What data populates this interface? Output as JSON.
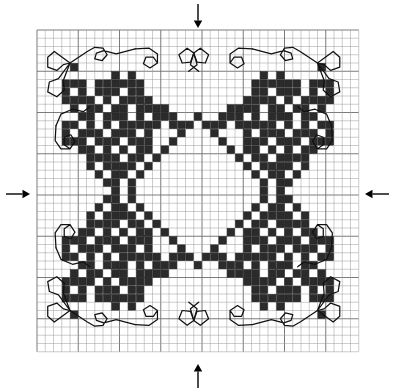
{
  "document": {
    "type": "cross-stitch-pattern-chart",
    "title": "Cross Stitch Pattern Chart",
    "description": "Symmetrical needlework chart with four corner floral motifs, a central open diamond, and backstitch scroll borders"
  },
  "colors": {
    "background": "#ffffff",
    "grid_line": "#9a9a9a",
    "grid_line_major": "#6d6d6d",
    "stitch_fill": "#2b2b2b",
    "stitch_stroke": "#111111",
    "backstitch": "#111111",
    "arrow": "#000000"
  },
  "grid": {
    "columns": 39,
    "rows": 39,
    "cell_size": 8.25,
    "origin_x": 37,
    "origin_y": 30,
    "major_every": 5,
    "show_grid": true
  },
  "center_markers": {
    "label": "center-arrows",
    "count": 4,
    "arrows": [
      {
        "name": "arrow-top",
        "direction": "down",
        "x": 198,
        "y": 4,
        "length": 24
      },
      {
        "name": "arrow-bottom",
        "direction": "up",
        "x": 198,
        "y": 388,
        "length": 24
      },
      {
        "name": "arrow-left",
        "direction": "right",
        "x": 6,
        "y": 194,
        "length": 24
      },
      {
        "name": "arrow-right",
        "direction": "left",
        "x": 389,
        "y": 194,
        "length": 24
      }
    ]
  },
  "chart_data": {
    "type": "heatmap",
    "xlabel": "",
    "ylabel": "",
    "grid_on": true,
    "legend": [],
    "categories": [],
    "values": [],
    "symmetry": "4-fold mirror (horizontal and vertical)",
    "quadrant_size": [
      20,
      20
    ],
    "note": "filled_cells lists [col,row] of the 20x20 top-left quadrant of the 39x39 chart; the full chart mirrors about col 19 and row 19",
    "filled_cells_quadrant": [
      [
        4,
        4
      ],
      [
        9,
        5
      ],
      [
        11,
        5
      ],
      [
        3,
        6
      ],
      [
        4,
        6
      ],
      [
        5,
        6
      ],
      [
        7,
        6
      ],
      [
        8,
        6
      ],
      [
        9,
        6
      ],
      [
        10,
        6
      ],
      [
        11,
        6
      ],
      [
        12,
        6
      ],
      [
        3,
        7
      ],
      [
        5,
        7
      ],
      [
        7,
        7
      ],
      [
        8,
        7
      ],
      [
        9,
        7
      ],
      [
        11,
        7
      ],
      [
        12,
        7
      ],
      [
        3,
        8
      ],
      [
        4,
        8
      ],
      [
        5,
        8
      ],
      [
        6,
        8
      ],
      [
        8,
        8
      ],
      [
        10,
        8
      ],
      [
        11,
        8
      ],
      [
        12,
        8
      ],
      [
        13,
        8
      ],
      [
        4,
        9
      ],
      [
        6,
        9
      ],
      [
        7,
        9
      ],
      [
        9,
        9
      ],
      [
        10,
        9
      ],
      [
        12,
        9
      ],
      [
        13,
        9
      ],
      [
        14,
        9
      ],
      [
        15,
        9
      ],
      [
        5,
        10
      ],
      [
        6,
        10
      ],
      [
        8,
        10
      ],
      [
        9,
        10
      ],
      [
        10,
        10
      ],
      [
        12,
        10
      ],
      [
        14,
        10
      ],
      [
        15,
        10
      ],
      [
        16,
        10
      ],
      [
        3,
        11
      ],
      [
        4,
        11
      ],
      [
        6,
        11
      ],
      [
        8,
        11
      ],
      [
        10,
        11
      ],
      [
        11,
        11
      ],
      [
        12,
        11
      ],
      [
        13,
        11
      ],
      [
        14,
        11
      ],
      [
        16,
        11
      ],
      [
        17,
        11
      ],
      [
        3,
        12
      ],
      [
        5,
        12
      ],
      [
        6,
        12
      ],
      [
        7,
        12
      ],
      [
        9,
        12
      ],
      [
        10,
        12
      ],
      [
        11,
        12
      ],
      [
        13,
        12
      ],
      [
        17,
        12
      ],
      [
        3,
        13
      ],
      [
        4,
        13
      ],
      [
        5,
        13
      ],
      [
        7,
        13
      ],
      [
        8,
        13
      ],
      [
        9,
        13
      ],
      [
        11,
        13
      ],
      [
        12,
        13
      ],
      [
        13,
        13
      ],
      [
        5,
        14
      ],
      [
        6,
        14
      ],
      [
        8,
        14
      ],
      [
        10,
        14
      ],
      [
        12,
        14
      ],
      [
        13,
        14
      ],
      [
        6,
        15
      ],
      [
        7,
        15
      ],
      [
        8,
        15
      ],
      [
        9,
        15
      ],
      [
        11,
        15
      ],
      [
        12,
        15
      ],
      [
        6,
        16
      ],
      [
        8,
        16
      ],
      [
        9,
        16
      ],
      [
        10,
        16
      ],
      [
        11,
        16
      ],
      [
        7,
        17
      ],
      [
        9,
        17
      ],
      [
        10,
        17
      ],
      [
        8,
        18
      ],
      [
        9,
        18
      ],
      [
        9,
        19
      ]
    ],
    "center_diamond_outline": [
      [
        19,
        10
      ],
      [
        18,
        11
      ],
      [
        20,
        11
      ],
      [
        17,
        12
      ],
      [
        21,
        12
      ],
      [
        16,
        13
      ],
      [
        22,
        13
      ],
      [
        15,
        14
      ],
      [
        23,
        14
      ],
      [
        14,
        15
      ],
      [
        24,
        15
      ],
      [
        13,
        16
      ],
      [
        25,
        16
      ],
      [
        12,
        17
      ],
      [
        26,
        17
      ],
      [
        11,
        18
      ],
      [
        27,
        18
      ],
      [
        11,
        19
      ],
      [
        27,
        19
      ],
      [
        11,
        20
      ],
      [
        27,
        20
      ],
      [
        12,
        21
      ],
      [
        26,
        21
      ],
      [
        13,
        22
      ],
      [
        25,
        22
      ],
      [
        14,
        23
      ],
      [
        24,
        23
      ],
      [
        15,
        24
      ],
      [
        23,
        24
      ],
      [
        16,
        25
      ],
      [
        22,
        25
      ],
      [
        17,
        26
      ],
      [
        21,
        26
      ],
      [
        18,
        27
      ],
      [
        20,
        27
      ],
      [
        19,
        28
      ]
    ],
    "backstitch_scrolls": {
      "count_per_corner": 4,
      "description": "Outlined curl / knot motifs drawn as thin black line work at each corner and along the mid-edges"
    }
  },
  "annotations": {
    "arrow_meaning": "centre of design markers"
  }
}
